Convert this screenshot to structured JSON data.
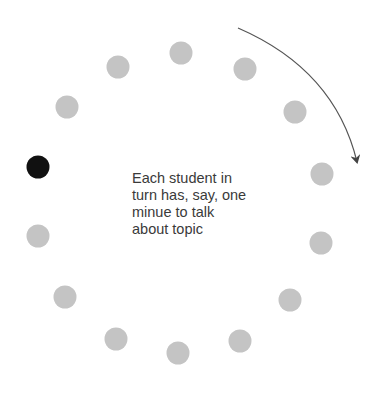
{
  "diagram": {
    "caption_lines": [
      "Each student in",
      "turn has, say, one",
      "minue to talk",
      "about topic"
    ],
    "colors": {
      "student": "#c4c4c4",
      "active_student": "#111111",
      "arrow": "#444444"
    },
    "students": [
      {
        "x": 181,
        "y": 53,
        "active": false
      },
      {
        "x": 245,
        "y": 69,
        "active": false
      },
      {
        "x": 295,
        "y": 112,
        "active": false
      },
      {
        "x": 322,
        "y": 174,
        "active": false
      },
      {
        "x": 321,
        "y": 243,
        "active": false
      },
      {
        "x": 290,
        "y": 300,
        "active": false
      },
      {
        "x": 240,
        "y": 341,
        "active": false
      },
      {
        "x": 178,
        "y": 353,
        "active": false
      },
      {
        "x": 116,
        "y": 339,
        "active": false
      },
      {
        "x": 65,
        "y": 297,
        "active": false
      },
      {
        "x": 38,
        "y": 236,
        "active": false
      },
      {
        "x": 38,
        "y": 167,
        "active": true
      },
      {
        "x": 67,
        "y": 107,
        "active": false
      },
      {
        "x": 118,
        "y": 67,
        "active": false
      }
    ],
    "arrow": {
      "direction": "clockwise"
    }
  }
}
